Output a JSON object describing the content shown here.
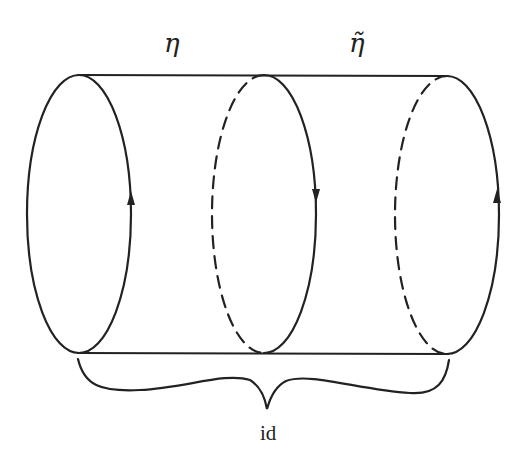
{
  "diagram": {
    "type": "cylinder-with-loops",
    "labels": {
      "eta": "η",
      "eta_tilde": "η̃",
      "brace": "id"
    },
    "loops": [
      {
        "name": "left-loop",
        "style": "solid-both",
        "arrow": "up"
      },
      {
        "name": "middle-loop",
        "style": "dashed-back-solid-front",
        "arrow": "down"
      },
      {
        "name": "right-loop",
        "style": "dashed-back-solid-front",
        "arrow": "up"
      }
    ],
    "colors": {
      "stroke": "#222222",
      "background": "#ffffff"
    }
  }
}
